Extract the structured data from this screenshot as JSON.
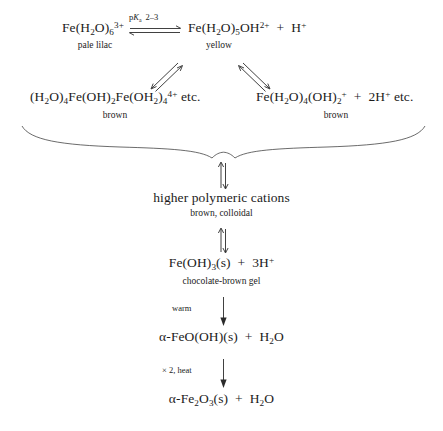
{
  "diagram": {
    "background": "#ffffff",
    "ink": "#1b1b1b"
  },
  "steps": {
    "hexaaqua": {
      "formula_prefix": "Fe(H",
      "label": "Fe(H2O)6 3+",
      "phase": "pale lilac"
    },
    "monohydroxo": {
      "label": "Fe(H2O)5OH 2+ + H+",
      "phase": "yellow"
    },
    "dimer": {
      "label": "(H2O)4Fe(OH)2Fe(OH2)4 4+ etc.",
      "phase": "brown"
    },
    "dihydroxo": {
      "label": "Fe(H2O)4(OH)2 + + 2H+ etc.",
      "phase": "brown"
    },
    "polymeric": {
      "label": "higher polymeric cations",
      "phase": "brown, colloidal"
    },
    "hydroxide": {
      "label": "Fe(OH)3(s) + 3H+",
      "phase": "chocolate-brown gel"
    },
    "goethite": {
      "label": "a-FeO(OH)(s) + H2O",
      "phase": ""
    },
    "hematite": {
      "label": "a-Fe2O3(s) + H2O",
      "phase": ""
    }
  },
  "conditions": {
    "pka": "pKa 2–3",
    "pka_symbol": "p",
    "pka_italic": "K",
    "pka_sub": "a",
    "pka_value": "2–3",
    "warm": "warm",
    "times_two_heat": "× 2, heat"
  },
  "arrows": {
    "top_equilibrium": "double-equilibrium-horizontal",
    "branch_left": "double-equilibrium-diagonal-left",
    "branch_right": "double-equilibrium-diagonal-right",
    "brace": "curly-brace-converging",
    "to_polymeric": "double-equilibrium-vertical",
    "to_hydroxide": "double-equilibrium-vertical",
    "to_goethite": "single-arrow-down",
    "to_hematite": "single-arrow-down"
  }
}
